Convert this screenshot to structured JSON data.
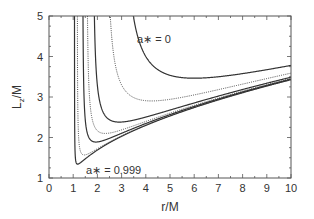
{
  "chart_data": {
    "type": "line",
    "title": "",
    "xlabel": "r/M",
    "ylabel": "L_z/M",
    "xlim": [
      0,
      10
    ],
    "ylim": [
      1,
      5
    ],
    "x_ticks": [
      "0",
      "1",
      "2",
      "3",
      "4",
      "5",
      "6",
      "7",
      "8",
      "9",
      "10"
    ],
    "y_ticks": [
      "1",
      "2",
      "3",
      "4",
      "5"
    ],
    "grid": false,
    "legend": "none",
    "annotations": [
      {
        "text": "a* = 0",
        "near_curve": "a=0"
      },
      {
        "text": "a* = 0.999",
        "near_curve": "a=0.999"
      }
    ],
    "series": [
      {
        "name": "a* = 0",
        "spin": 0,
        "style": "solid",
        "min_r": 6.0,
        "min_L": 3.46,
        "L_at_r10": 3.78
      },
      {
        "name": "a* = 0.5",
        "spin": 0.5,
        "style": "dotted",
        "min_r": 4.23,
        "min_L": 2.9,
        "L_at_r10": 3.6
      },
      {
        "name": "a* = 0.8",
        "spin": 0.8,
        "style": "solid",
        "min_r": 2.91,
        "min_L": 2.38,
        "L_at_r10": 3.5
      },
      {
        "name": "a* = 0.9",
        "spin": 0.9,
        "style": "dotted",
        "min_r": 2.32,
        "min_L": 2.1,
        "L_at_r10": 3.47
      },
      {
        "name": "a* = 0.95",
        "spin": 0.95,
        "style": "solid",
        "min_r": 1.94,
        "min_L": 1.9,
        "L_at_r10": 3.45
      },
      {
        "name": "a* = 0.99",
        "spin": 0.99,
        "style": "dotted",
        "min_r": 1.45,
        "min_L": 1.6,
        "L_at_r10": 3.42
      },
      {
        "name": "a* = 0.999",
        "spin": 0.999,
        "style": "solid",
        "min_r": 1.18,
        "min_L": 1.35,
        "L_at_r10": 3.41
      }
    ]
  },
  "labels": {
    "xlabel": "r/M",
    "ylabel_main": "L",
    "ylabel_sub": "z",
    "ylabel_tail": "/M",
    "annot_top": "a∗ = 0",
    "annot_bottom": "a∗ = 0.999"
  },
  "colors": {
    "axis": "#555555",
    "curve": "#333333",
    "text": "#333333"
  }
}
